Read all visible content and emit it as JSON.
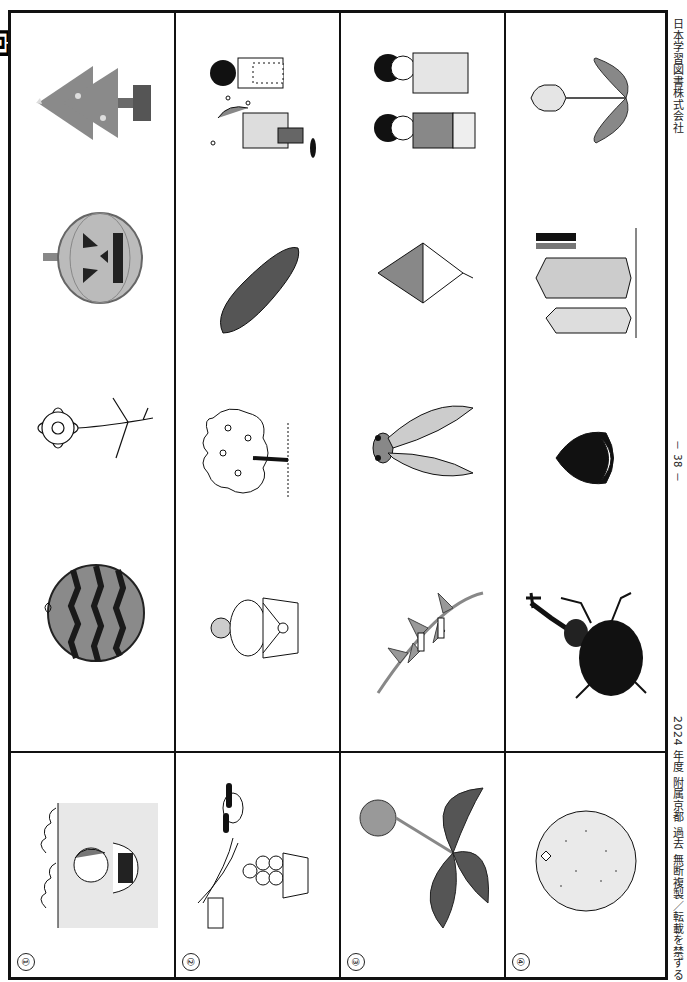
{
  "page": {
    "orientation": "rotated-90-clockwise",
    "title_fragment": "問題",
    "publisher": "日本学習図書株式会社",
    "footer": "2024 年度 附属京都 過去 無断複製／転載を禁ずる",
    "page_number": "－ 38 －"
  },
  "rows": [
    {
      "number": "①",
      "reference": {
        "label": "child swimming in sea",
        "icon": "swimming-child-icon"
      },
      "choices": [
        {
          "label": "watermelon",
          "icon": "watermelon-icon"
        },
        {
          "label": "cosmos flower",
          "icon": "cosmos-icon"
        },
        {
          "label": "jack-o-lantern pumpkin",
          "icon": "pumpkin-icon"
        },
        {
          "label": "christmas tree",
          "icon": "christmas-tree-icon"
        }
      ]
    },
    {
      "number": "②",
      "reference": {
        "label": "moon viewing with dango and susuki",
        "icon": "tsukimi-icon"
      },
      "choices": [
        {
          "label": "kagami mochi",
          "icon": "kagami-mochi-icon"
        },
        {
          "label": "cherry blossom tree",
          "icon": "sakura-tree-icon"
        },
        {
          "label": "sweet potato",
          "icon": "sweet-potato-icon"
        },
        {
          "label": "setsubun bean throwing at oni",
          "icon": "setsubun-icon"
        }
      ]
    },
    {
      "number": "③",
      "reference": {
        "label": "dandelion",
        "icon": "dandelion-icon"
      },
      "choices": [
        {
          "label": "tanabata bamboo",
          "icon": "tanabata-icon"
        },
        {
          "label": "cicada",
          "icon": "cicada-icon"
        },
        {
          "label": "kite",
          "icon": "kite-icon"
        },
        {
          "label": "shichi-go-san children",
          "icon": "shichigosan-icon"
        }
      ]
    },
    {
      "number": "④",
      "reference": {
        "label": "mandarin orange",
        "icon": "mikan-icon"
      },
      "choices": [
        {
          "label": "rhinoceros beetle",
          "icon": "beetle-icon"
        },
        {
          "label": "chestnut",
          "icon": "chestnut-icon"
        },
        {
          "label": "koinobori carp streamers",
          "icon": "koinobori-icon"
        },
        {
          "label": "tulip",
          "icon": "tulip-icon"
        }
      ]
    }
  ],
  "colors": {
    "line": "#111111",
    "gray": "#8a8a8a",
    "dark": "#2a2a2a",
    "light": "#d6d6d6"
  }
}
